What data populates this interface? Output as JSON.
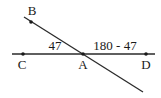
{
  "diagram": {
    "type": "intersecting-lines-angles",
    "stroke_color": "#2a2a2a",
    "lines": [
      {
        "name": "line-CD",
        "from": [
          12,
          54
        ],
        "to": [
          155,
          54
        ]
      },
      {
        "name": "line-BA",
        "from": [
          24,
          17
        ],
        "to": [
          143,
          92
        ]
      }
    ],
    "points": [
      {
        "id": "B",
        "label": "B",
        "x": 31,
        "y": 22,
        "label_x": 32,
        "label_y": 15
      },
      {
        "id": "C",
        "label": "C",
        "x": 23,
        "y": 54,
        "label_x": 22,
        "label_y": 69
      },
      {
        "id": "A",
        "label": "A",
        "x": 83,
        "y": 54,
        "label_x": 83,
        "label_y": 69
      },
      {
        "id": "D",
        "label": "D",
        "x": 146,
        "y": 54,
        "label_x": 146,
        "label_y": 69
      }
    ],
    "angles": [
      {
        "name": "angle-CAB",
        "label": "47",
        "x": 55,
        "y": 50
      },
      {
        "name": "angle-BAD",
        "label": "180 - 47",
        "x": 115,
        "y": 50
      }
    ]
  }
}
